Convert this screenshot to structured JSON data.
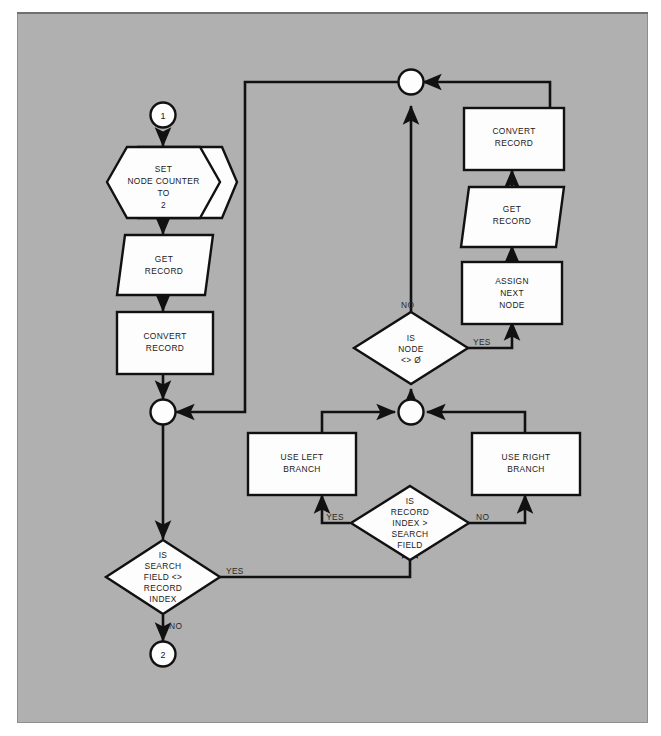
{
  "diagram": {
    "background_color": "#b0b0b0",
    "shape_fill": "#fdfdfd",
    "line_color": "#111111",
    "connectors": [
      {
        "name": "start-connector",
        "label": "1"
      },
      {
        "name": "end-connector",
        "label": "2"
      }
    ],
    "nodes": [
      {
        "id": "set-node-counter",
        "type": "preparation-hexagon",
        "lines": [
          "SET",
          "NODE COUNTER",
          "TO",
          "2"
        ]
      },
      {
        "id": "get-record-left",
        "type": "input-output-parallelogram",
        "lines": [
          "GET",
          "RECORD"
        ]
      },
      {
        "id": "convert-record-left",
        "type": "process-box",
        "lines": [
          "CONVERT",
          "RECORD"
        ]
      },
      {
        "id": "is-search-field-ne-record-index",
        "type": "decision-diamond",
        "lines": [
          "IS",
          "SEARCH",
          "FIELD <>",
          "RECORD",
          "INDEX"
        ]
      },
      {
        "id": "is-record-index-gt-search-field",
        "type": "decision-diamond",
        "lines": [
          "IS",
          "RECORD",
          "INDEX >",
          "SEARCH",
          "FIELD"
        ]
      },
      {
        "id": "use-left-branch",
        "type": "process-box",
        "lines": [
          "USE LEFT",
          "BRANCH"
        ]
      },
      {
        "id": "use-right-branch",
        "type": "process-box",
        "lines": [
          "USE RIGHT",
          "BRANCH"
        ]
      },
      {
        "id": "is-node-ne-zero",
        "type": "decision-diamond",
        "lines": [
          "IS",
          "NODE",
          "<> Ø"
        ]
      },
      {
        "id": "assign-next-node",
        "type": "process-box",
        "lines": [
          "ASSIGN",
          "NEXT",
          "NODE"
        ]
      },
      {
        "id": "get-record-right",
        "type": "input-output-parallelogram",
        "lines": [
          "GET",
          "RECORD"
        ]
      },
      {
        "id": "convert-record-right",
        "type": "process-box",
        "lines": [
          "CONVERT",
          "RECORD"
        ]
      }
    ],
    "edge_labels": [
      {
        "id": "node-diamond-no",
        "text": "NO"
      },
      {
        "id": "node-diamond-yes",
        "text": "YES"
      },
      {
        "id": "record-index-yes",
        "text": "YES"
      },
      {
        "id": "record-index-no",
        "text": "NO"
      },
      {
        "id": "search-field-yes",
        "text": "YES"
      },
      {
        "id": "search-field-no",
        "text": "NO"
      }
    ]
  }
}
